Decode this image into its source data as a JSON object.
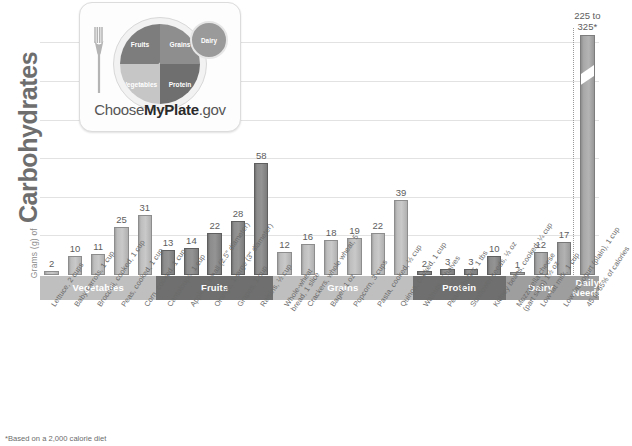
{
  "axis": {
    "y_title_small": "Grams (g) of",
    "y_title_big": "Carbohydrates"
  },
  "footnote": "*Based on a 2,000 calorie diet",
  "logo": {
    "brand_pre": "Choose",
    "brand_mid": "MyPlate",
    "brand_post": ".gov",
    "fruits": "Fruits",
    "vegetables": "Vegetables",
    "grains": "Grains",
    "protein": "Protein",
    "dairy": "Dairy",
    "fork_icon": "fork-icon"
  },
  "daily_needs": {
    "value_line1": "225 to",
    "value_line2": "325*",
    "band_line1": "Daily",
    "band_line2": "Needs",
    "tick": "45 to 65% of calories"
  },
  "chart_data": {
    "type": "bar",
    "xlabel": "",
    "ylabel": "Grams (g) of Carbohydrates",
    "ylim": [
      0,
      140
    ],
    "grid": true,
    "legend": "none",
    "groups": [
      {
        "name": "Vegetables",
        "shade": "light",
        "items": [
          {
            "label": "Lettuce, 2 cups",
            "value": 2
          },
          {
            "label": "Baby carrots, 1 cup",
            "value": 10
          },
          {
            "label": "Broccoli, cooked, 1 cup",
            "value": 11
          },
          {
            "label": "Peas, cooked, 1 cup",
            "value": 25
          },
          {
            "label": "Corn, cooked, 1 cup",
            "value": 31
          }
        ]
      },
      {
        "name": "Fruits",
        "shade": "dark",
        "items": [
          {
            "label": "Cantaloupe, 1 cup",
            "value": 13
          },
          {
            "label": "Apple, 1 small (2.5\" diameter)",
            "value": 14
          },
          {
            "label": "Orange, 1 large (3\" diameter)",
            "value": 22
          },
          {
            "label": "Grapes, 1 cup",
            "value": 28
          },
          {
            "label": "Raisins, ½ cup",
            "value": 58
          }
        ]
      },
      {
        "name": "Grains",
        "shade": "light",
        "items": [
          {
            "label": "Whole-wheat\nbread, 1 slice",
            "value": 12
          },
          {
            "label": "Crackers, whole wheat, 5",
            "value": 16
          },
          {
            "label": "Bagel, 1 oz",
            "value": 18
          },
          {
            "label": "Popcorn, 3 cups",
            "value": 19
          },
          {
            "label": "Pasta, cooked, ½ cup",
            "value": 22
          },
          {
            "label": "Quinoa, cooked, 1 cup",
            "value": 39
          }
        ]
      },
      {
        "name": "Protein",
        "shade": "dark",
        "items": [
          {
            "label": "Walnuts, 7 halves",
            "value": 2
          },
          {
            "label": "Peanut butter, 1 tbs",
            "value": 3
          },
          {
            "label": "Sunflower seeds, ½ oz",
            "value": 3
          },
          {
            "label": "Kidney beans, cooked, ¼ cup",
            "value": 10
          }
        ]
      },
      {
        "name": "Dairy",
        "shade": "mid",
        "items": [
          {
            "label": "Mozzarella cheese\n(part skim) 1½ oz",
            "value": 1
          },
          {
            "label": "Low-fat milk, 1 cup",
            "value": 12
          },
          {
            "label": "Low-fat yogurt (plain), 1 cup",
            "value": 17
          }
        ]
      },
      {
        "name": "Daily Needs",
        "shade": "mid",
        "broken_axis": true,
        "items": [
          {
            "label": "45 to 65% of calories",
            "value": 325,
            "display": "225 to 325*"
          }
        ]
      }
    ]
  }
}
